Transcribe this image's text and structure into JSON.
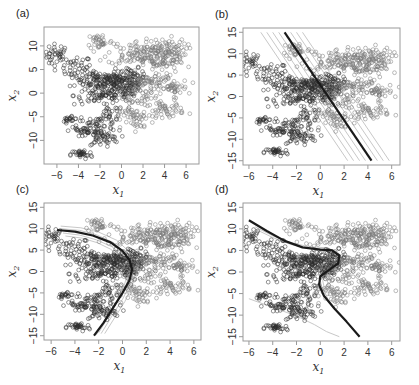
{
  "chart_data": [
    {
      "panel": "(a)",
      "type": "scatter",
      "xlabel": "x1",
      "ylabel": "x2",
      "xticks": [
        -6,
        -4,
        -2,
        0,
        2,
        4,
        6
      ],
      "yticks": [
        -10,
        -5,
        0,
        5,
        10
      ],
      "xlim": [
        -7.2,
        7.2
      ],
      "ylim": [
        -15,
        14
      ],
      "box": {
        "left": 44,
        "top": 27,
        "right": 199,
        "bottom": 164
      },
      "decision_curves": []
    },
    {
      "panel": "(b)",
      "type": "scatter",
      "xlabel": "x1",
      "ylabel": "x2",
      "xticks": [
        -6,
        -4,
        -2,
        0,
        2,
        4,
        6
      ],
      "yticks": [
        -15,
        -10,
        -5,
        0,
        5,
        10,
        15
      ],
      "xlim": [
        -6.5,
        6.7
      ],
      "ylim": [
        -16,
        16
      ],
      "box": {
        "left": 243,
        "top": 28,
        "right": 400,
        "bottom": 165
      },
      "decision_curves": [
        {
          "name": "boundary",
          "style": "bold",
          "points": [
            [
              -3.0,
              15
            ],
            [
              4.3,
              -15
            ]
          ]
        },
        {
          "name": "sample-1",
          "style": "faint",
          "points": [
            [
              -5.0,
              15
            ],
            [
              2.3,
              -15
            ]
          ]
        },
        {
          "name": "sample-2",
          "style": "faint",
          "points": [
            [
              -4.5,
              15
            ],
            [
              2.8,
              -15
            ]
          ]
        },
        {
          "name": "sample-3",
          "style": "faint",
          "points": [
            [
              -4.0,
              15
            ],
            [
              3.3,
              -15
            ]
          ]
        },
        {
          "name": "sample-4",
          "style": "faint",
          "points": [
            [
              -3.5,
              15
            ],
            [
              3.8,
              -15
            ]
          ]
        },
        {
          "name": "sample-5",
          "style": "faint",
          "points": [
            [
              -2.5,
              15
            ],
            [
              4.8,
              -15
            ]
          ]
        },
        {
          "name": "sample-6",
          "style": "faint",
          "points": [
            [
              -2.0,
              15
            ],
            [
              5.3,
              -15
            ]
          ]
        },
        {
          "name": "sample-7",
          "style": "faint",
          "points": [
            [
              -1.5,
              15
            ],
            [
              5.8,
              -15
            ]
          ]
        }
      ]
    },
    {
      "panel": "(c)",
      "type": "scatter",
      "xlabel": "x1",
      "ylabel": "x2",
      "xticks": [
        -6,
        -4,
        -2,
        0,
        2,
        4,
        6
      ],
      "yticks": [
        -15,
        -10,
        -5,
        0,
        5,
        10,
        15
      ],
      "xlim": [
        -6.6,
        6.6
      ],
      "ylim": [
        -16,
        16
      ],
      "box": {
        "left": 44,
        "top": 203,
        "right": 201,
        "bottom": 340
      },
      "decision_curves": [
        {
          "name": "boundary",
          "style": "bold",
          "points": [
            [
              -5.5,
              9.7
            ],
            [
              -4,
              9.3
            ],
            [
              -2.5,
              8.4
            ],
            [
              -1,
              6.8
            ],
            [
              0,
              4.8
            ],
            [
              0.6,
              2.6
            ],
            [
              0.8,
              0.5
            ],
            [
              0.6,
              -2
            ],
            [
              0,
              -5
            ],
            [
              -0.8,
              -8.5
            ],
            [
              -1.6,
              -12
            ],
            [
              -2.4,
              -15
            ]
          ]
        },
        {
          "name": "sample-1",
          "style": "faint",
          "points": [
            [
              -5.2,
              10.6
            ],
            [
              -3.5,
              10.2
            ],
            [
              -2,
              9.2
            ],
            [
              -0.5,
              7.3
            ],
            [
              0.5,
              4.8
            ],
            [
              1.0,
              2.2
            ],
            [
              1.1,
              -0.5
            ],
            [
              0.8,
              -3.5
            ],
            [
              0.2,
              -7
            ],
            [
              -0.6,
              -10.5
            ],
            [
              -1.5,
              -14.5
            ]
          ]
        },
        {
          "name": "sample-2",
          "style": "faint",
          "points": [
            [
              -5.2,
              10.0
            ],
            [
              -3.6,
              9.6
            ],
            [
              -2.2,
              8.6
            ],
            [
              -0.8,
              6.8
            ],
            [
              0.2,
              4.5
            ],
            [
              0.8,
              2.0
            ],
            [
              0.9,
              -0.5
            ],
            [
              0.6,
              -3.2
            ],
            [
              0,
              -6.5
            ],
            [
              -0.8,
              -10
            ],
            [
              -1.8,
              -14.5
            ]
          ]
        },
        {
          "name": "sample-3",
          "style": "faint",
          "points": [
            [
              -5.0,
              9.0
            ],
            [
              -3.6,
              8.5
            ],
            [
              -2.2,
              7.4
            ],
            [
              -0.9,
              5.8
            ],
            [
              0.0,
              3.9
            ],
            [
              0.5,
              1.8
            ],
            [
              0.6,
              -0.5
            ],
            [
              0.3,
              -3.2
            ],
            [
              -0.3,
              -6.5
            ],
            [
              -1.1,
              -10.2
            ],
            [
              -2.0,
              -14.3
            ]
          ]
        },
        {
          "name": "sample-4",
          "style": "faint",
          "points": [
            [
              -4.8,
              8.3
            ],
            [
              -3.4,
              7.8
            ],
            [
              -2.1,
              6.7
            ],
            [
              -1.0,
              5.2
            ],
            [
              -0.2,
              3.5
            ],
            [
              0.3,
              1.5
            ],
            [
              0.4,
              -0.8
            ],
            [
              0.1,
              -3.6
            ],
            [
              -0.5,
              -7
            ],
            [
              -1.3,
              -10.8
            ],
            [
              -2.2,
              -14.8
            ]
          ]
        }
      ]
    },
    {
      "panel": "(d)",
      "type": "scatter",
      "xlabel": "x1",
      "ylabel": "x2",
      "xticks": [
        -6,
        -4,
        -2,
        0,
        2,
        4,
        6
      ],
      "yticks": [
        -15,
        -10,
        -5,
        0,
        5,
        10,
        15
      ],
      "xlim": [
        -6.5,
        6.7
      ],
      "ylim": [
        -16,
        16
      ],
      "box": {
        "left": 243,
        "top": 203,
        "right": 400,
        "bottom": 341
      },
      "decision_curves": [
        {
          "name": "boundary",
          "style": "bold",
          "points": [
            [
              -6,
              12
            ],
            [
              -4.5,
              9.5
            ],
            [
              -3,
              7.2
            ],
            [
              -1.5,
              5.7
            ],
            [
              0,
              5.2
            ],
            [
              1,
              5
            ],
            [
              1.6,
              3.8
            ],
            [
              1.5,
              2.0
            ],
            [
              0.8,
              0.6
            ],
            [
              0,
              -1
            ],
            [
              -0.1,
              -3
            ],
            [
              0.3,
              -5.5
            ],
            [
              1.2,
              -8.5
            ],
            [
              2.2,
              -11.5
            ],
            [
              3.3,
              -15
            ]
          ]
        },
        {
          "name": "sample-1",
          "style": "faint",
          "points": [
            [
              -5.5,
              10.5
            ],
            [
              -4,
              8.4
            ],
            [
              -2.5,
              6.8
            ],
            [
              -1,
              5.9
            ],
            [
              0.5,
              5.6
            ],
            [
              1.4,
              4.8
            ],
            [
              1.8,
              3.0
            ],
            [
              1.4,
              1.2
            ],
            [
              0.6,
              0
            ],
            [
              0.2,
              -2
            ],
            [
              0.4,
              -4.5
            ]
          ]
        },
        {
          "name": "sample-2",
          "style": "faint",
          "points": [
            [
              -5.5,
              10.0
            ],
            [
              -4,
              8.0
            ],
            [
              -2.5,
              6.4
            ],
            [
              -1,
              5.5
            ],
            [
              0.5,
              5.3
            ],
            [
              1.3,
              4.4
            ],
            [
              1.6,
              2.8
            ],
            [
              1.2,
              1.2
            ],
            [
              0.4,
              0
            ],
            [
              0.0,
              -2
            ],
            [
              0.2,
              -4.5
            ]
          ]
        },
        {
          "name": "lower",
          "style": "faint",
          "points": [
            [
              -6,
              -6.2
            ],
            [
              -4,
              -8.2
            ],
            [
              -2,
              -10.2
            ],
            [
              -0.5,
              -12.2
            ],
            [
              0.5,
              -13.8
            ],
            [
              1.6,
              -15
            ]
          ]
        }
      ]
    }
  ],
  "scatter_clusters": [
    {
      "cls": "A",
      "cx": -6.0,
      "cy": 8.0,
      "sx": 0.6,
      "sy": 1.2,
      "n": 40
    },
    {
      "cls": "A",
      "cx": -4.2,
      "cy": 5.5,
      "sx": 0.7,
      "sy": 1.2,
      "n": 30
    },
    {
      "cls": "A",
      "cx": -2.5,
      "cy": 3.0,
      "sx": 1.2,
      "sy": 1.0,
      "n": 80
    },
    {
      "cls": "A",
      "cx": -0.5,
      "cy": 2.5,
      "sx": 1.2,
      "sy": 1.2,
      "n": 100
    },
    {
      "cls": "A",
      "cx": 1.0,
      "cy": 3.2,
      "sx": 0.6,
      "sy": 1.0,
      "n": 50
    },
    {
      "cls": "A",
      "cx": -2.0,
      "cy": -0.5,
      "sx": 1.2,
      "sy": 1.0,
      "n": 70
    },
    {
      "cls": "A",
      "cx": 0.3,
      "cy": 0.2,
      "sx": 0.8,
      "sy": 1.2,
      "n": 50
    },
    {
      "cls": "A",
      "cx": -1.0,
      "cy": -4.5,
      "sx": 0.6,
      "sy": 1.0,
      "n": 25
    },
    {
      "cls": "A",
      "cx": -4.7,
      "cy": -5.5,
      "sx": 0.4,
      "sy": 0.5,
      "n": 20
    },
    {
      "cls": "A",
      "cx": -2.3,
      "cy": -7.0,
      "sx": 1.0,
      "sy": 1.0,
      "n": 60
    },
    {
      "cls": "A",
      "cx": -3.8,
      "cy": -8.0,
      "sx": 0.5,
      "sy": 0.5,
      "n": 20
    },
    {
      "cls": "A",
      "cx": -1.8,
      "cy": -9.5,
      "sx": 0.8,
      "sy": 0.8,
      "n": 40
    },
    {
      "cls": "A",
      "cx": -3.7,
      "cy": -13.0,
      "sx": 0.5,
      "sy": 0.5,
      "n": 35
    },
    {
      "cls": "B",
      "cx": -2.0,
      "cy": 11.0,
      "sx": 0.6,
      "sy": 0.9,
      "n": 35
    },
    {
      "cls": "B",
      "cx": 1.5,
      "cy": 8.5,
      "sx": 1.4,
      "sy": 1.3,
      "n": 90
    },
    {
      "cls": "B",
      "cx": 4.0,
      "cy": 9.0,
      "sx": 1.0,
      "sy": 1.3,
      "n": 90
    },
    {
      "cls": "B",
      "cx": 3.5,
      "cy": 6.5,
      "sx": 1.2,
      "sy": 1.0,
      "n": 60
    },
    {
      "cls": "B",
      "cx": 3.0,
      "cy": 2.5,
      "sx": 1.2,
      "sy": 1.0,
      "n": 70
    },
    {
      "cls": "B",
      "cx": 4.8,
      "cy": 1.0,
      "sx": 0.7,
      "sy": 1.0,
      "n": 35
    },
    {
      "cls": "B",
      "cx": 1.5,
      "cy": -1.0,
      "sx": 1.0,
      "sy": 1.0,
      "n": 35
    },
    {
      "cls": "B",
      "cx": 1.5,
      "cy": -5.0,
      "sx": 1.2,
      "sy": 0.8,
      "n": 40
    },
    {
      "cls": "B",
      "cx": 4.0,
      "cy": -3.5,
      "sx": 0.9,
      "sy": 0.8,
      "n": 50
    },
    {
      "cls": "B",
      "cx": 1.8,
      "cy": -7.0,
      "sx": 0.4,
      "sy": 0.4,
      "n": 10
    }
  ],
  "colors": {
    "class_A": "#2e2e2e",
    "class_B": "#7a7a7a",
    "boundary": "#1a1a1a",
    "faint_line": "#c8c8c8",
    "frame": "#9a9a9a",
    "text": "#333333"
  }
}
